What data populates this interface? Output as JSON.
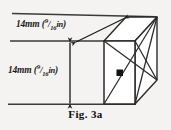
{
  "figure": {
    "caption_prefix": "Fig.",
    "caption_number": "3a",
    "background_color": "#f4f3f1",
    "line_color": "#2b2b2b",
    "face_color": "#ffffff"
  },
  "dimensions": [
    {
      "id": "top-width",
      "value": "14mm",
      "paren_open": "(",
      "fraction_numerator": "9",
      "fraction_slash": "/",
      "fraction_denominator": "16",
      "unit": "in",
      "paren_close": ")",
      "full_text": "14mm (9/16in)",
      "orientation": "diagonal-top"
    },
    {
      "id": "side-height",
      "value": "14mm",
      "paren_open": "(",
      "fraction_numerator": "9",
      "fraction_slash": "/",
      "fraction_denominator": "16",
      "unit": "in",
      "paren_close": ")",
      "full_text": "14mm (9/16in)",
      "orientation": "vertical-left"
    }
  ],
  "geometry": {
    "type": "rectangular-box-oblique",
    "front_face": {
      "left": 104,
      "top": 41,
      "right": 135,
      "bottom": 104
    },
    "back_offset": {
      "dx": 22,
      "dy": -24
    },
    "center_dot": {
      "x": 119.5,
      "y": 72.5
    },
    "diagonals": "x-cross-on-right-face"
  }
}
